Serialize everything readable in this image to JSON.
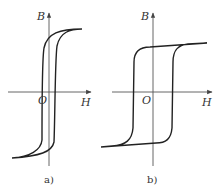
{
  "figure": {
    "panels": [
      {
        "id": "a",
        "caption": "a)",
        "y_axis_label": "B",
        "x_axis_label": "H",
        "origin_label": "O",
        "shape": "narrow loop (soft magnetic material)"
      },
      {
        "id": "b",
        "caption": "b)",
        "y_axis_label": "B",
        "x_axis_label": "H",
        "origin_label": "O",
        "shape": "wide rectangular loop (hard magnetic material)"
      }
    ]
  },
  "colors": {
    "background": "#ffffff",
    "curve": "#222222",
    "axis": "#555555",
    "text": "#333333"
  }
}
